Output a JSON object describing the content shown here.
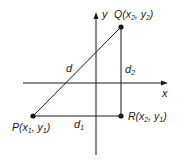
{
  "diagram": {
    "axes": {
      "x_label": "x",
      "y_label": "y"
    },
    "points": {
      "P": {
        "name": "P",
        "open": "(",
        "x": "x",
        "xsub": "1",
        "sep": ", ",
        "y": "y",
        "ysub": "1",
        "close": ")"
      },
      "Q": {
        "name": "Q",
        "open": "(",
        "x": "x",
        "xsub": "2",
        "sep": ", ",
        "y": "y",
        "ysub": "2",
        "close": ")"
      },
      "R": {
        "name": "R",
        "open": "(",
        "x": "x",
        "xsub": "2",
        "sep": ", ",
        "y": "y",
        "ysub": "1",
        "close": ")"
      }
    },
    "segments": {
      "d": "d",
      "d1": {
        "base": "d",
        "sub": "1"
      },
      "d2": {
        "base": "d",
        "sub": "2"
      }
    },
    "colors": {
      "line": "#1a1a1a",
      "background": "#ffffff"
    }
  }
}
